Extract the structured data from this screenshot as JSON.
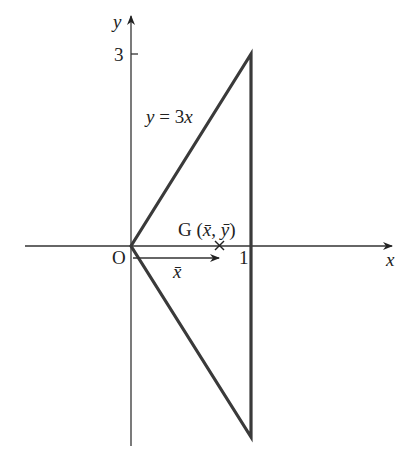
{
  "diagram": {
    "axes": {
      "x_label": "x",
      "y_label": "y",
      "origin_label": "O",
      "x_tick_label": "1",
      "y_tick_label": "3"
    },
    "curve_label": {
      "lhs": "y",
      "eq": " = 3",
      "rhs": "x"
    },
    "centroid": {
      "label_G": "G (",
      "xbar": "x̄",
      "comma": ", ",
      "ybar": "ȳ",
      "close": ")"
    },
    "arrow_label": "x̄",
    "colors": {
      "triangle": "#3a3a3a",
      "axes": "#333333",
      "text": "#222222"
    }
  }
}
